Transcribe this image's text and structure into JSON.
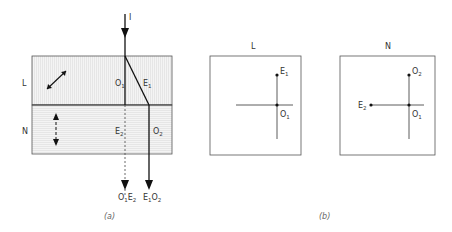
{
  "figure_a": {
    "incident_label": "I",
    "layer_top_label": "L",
    "layer_bottom_label": "N",
    "ray_labels": {
      "o1": {
        "main": "O",
        "sub": "1"
      },
      "e1": {
        "main": "E",
        "sub": "1"
      },
      "e2": {
        "main": "E",
        "sub": "2"
      },
      "o2": {
        "main": "O",
        "sub": "2"
      }
    },
    "output_labels": {
      "left": {
        "a": "O",
        "a_sub": "1",
        "b": "E",
        "b_sub": "2"
      },
      "right": {
        "a": "E",
        "a_sub": "1",
        "b": "O",
        "b_sub": "2"
      }
    },
    "caption": "(a)"
  },
  "figure_b": {
    "panel_l": {
      "title": "L",
      "points": [
        {
          "main": "E",
          "sub": "1"
        },
        {
          "main": "O",
          "sub": "1"
        }
      ]
    },
    "panel_n": {
      "title": "N",
      "points": [
        {
          "main": "O",
          "sub": "2"
        },
        {
          "main": "E",
          "sub": "2"
        },
        {
          "main": "O",
          "sub": "1"
        }
      ]
    },
    "caption": "(b)"
  },
  "colors": {
    "line": "#111111",
    "frame": "#555555",
    "hatch": "#d8d8d8",
    "text": "#333333"
  }
}
